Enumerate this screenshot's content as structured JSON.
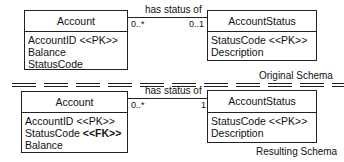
{
  "original": {
    "caption": "Original Schema",
    "account": {
      "title": "Account",
      "attributes": [
        {
          "name": "AccountID",
          "stereotype": "<<PK>>"
        },
        {
          "name": "Balance",
          "stereotype": ""
        },
        {
          "name": "StatusCode",
          "stereotype": ""
        }
      ]
    },
    "account_status": {
      "title": "AccountStatus",
      "attributes": [
        {
          "name": "StatusCode",
          "stereotype": "<<PK>>"
        },
        {
          "name": "Description",
          "stereotype": ""
        }
      ]
    },
    "association": {
      "label": "has status of",
      "left_multiplicity": "0..*",
      "right_multiplicity": "0..1"
    }
  },
  "resulting": {
    "caption": "Resulting Schema",
    "account": {
      "title": "Account",
      "attributes": [
        {
          "name": "AccountID",
          "stereotype": "<<PK>>",
          "bold": false
        },
        {
          "name": "StatusCode",
          "stereotype": "<<FK>>",
          "bold": true
        },
        {
          "name": "Balance",
          "stereotype": "",
          "bold": false
        }
      ]
    },
    "account_status": {
      "title": "AccountStatus",
      "attributes": [
        {
          "name": "StatusCode",
          "stereotype": "<<PK>>"
        },
        {
          "name": "Description",
          "stereotype": ""
        }
      ]
    },
    "association": {
      "label": "has status of",
      "left_multiplicity": "0..*",
      "right_multiplicity": "1"
    }
  },
  "colors": {
    "line": "#222222",
    "background": "#ffffff"
  }
}
